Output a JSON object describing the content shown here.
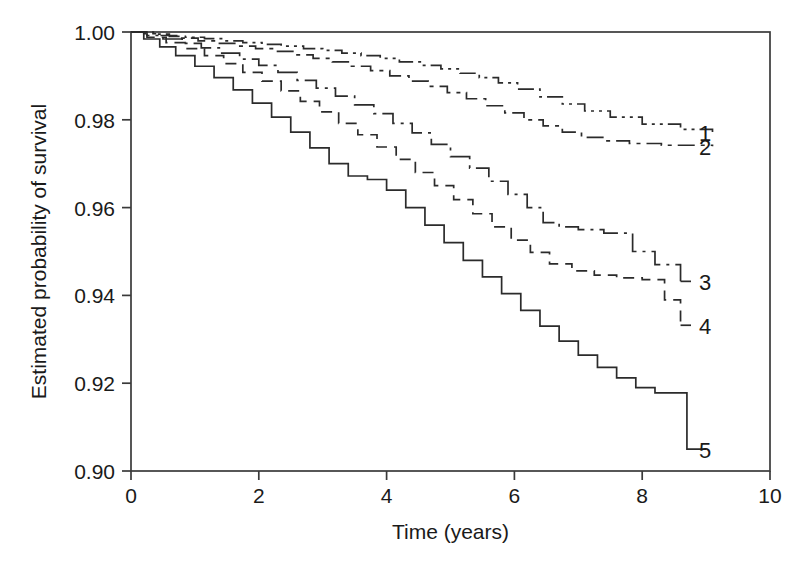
{
  "chart_data": {
    "type": "line",
    "title": "",
    "xlabel": "Time (years)",
    "ylabel": "Estimated probability of survival",
    "xlim": [
      0,
      10
    ],
    "ylim": [
      0.9,
      1.0
    ],
    "xticks": [
      "0",
      "2",
      "4",
      "6",
      "8",
      "10"
    ],
    "xtick_values": [
      0,
      2,
      4,
      6,
      8,
      10
    ],
    "yticks": [
      "1.00",
      "0.98",
      "0.96",
      "0.94",
      "0.92",
      "0.90"
    ],
    "ytick_values": [
      1.0,
      0.98,
      0.96,
      0.94,
      0.92,
      0.9
    ],
    "grid": false,
    "legend_position": "right-of-curve-ends",
    "step_style": "post",
    "series": [
      {
        "name": "1",
        "label": "1",
        "linestyle": "dash-dot-dot",
        "color": "#2b2b2b",
        "final_value": 0.977,
        "x": [
          0.0,
          0.15,
          0.35,
          0.6,
          0.85,
          1.15,
          1.45,
          1.75,
          2.05,
          2.35,
          2.7,
          3.0,
          3.3,
          3.6,
          3.9,
          4.2,
          4.55,
          4.85,
          5.15,
          5.45,
          5.75,
          6.05,
          6.4,
          6.75,
          7.1,
          7.5,
          8.0,
          8.6,
          9.1
        ],
        "y": [
          1.0,
          1.0,
          0.9995,
          0.999,
          0.9988,
          0.9985,
          0.998,
          0.9976,
          0.9972,
          0.9968,
          0.9962,
          0.9958,
          0.9952,
          0.9946,
          0.994,
          0.9932,
          0.9924,
          0.9916,
          0.9906,
          0.9896,
          0.9884,
          0.987,
          0.9852,
          0.9836,
          0.982,
          0.9806,
          0.979,
          0.9778,
          0.9772
        ]
      },
      {
        "name": "2",
        "label": "2",
        "linestyle": "dash-dot",
        "color": "#2b2b2b",
        "final_value": 0.974,
        "x": [
          0.0,
          0.2,
          0.45,
          0.75,
          1.05,
          1.35,
          1.65,
          1.95,
          2.25,
          2.55,
          2.85,
          3.15,
          3.45,
          3.75,
          4.05,
          4.35,
          4.65,
          4.95,
          5.25,
          5.55,
          5.85,
          6.15,
          6.45,
          6.75,
          7.05,
          7.4,
          7.8,
          8.3,
          9.1
        ],
        "y": [
          1.0,
          0.9996,
          0.9992,
          0.9986,
          0.998,
          0.9974,
          0.9968,
          0.9962,
          0.9956,
          0.9948,
          0.994,
          0.9932,
          0.9922,
          0.9912,
          0.99,
          0.9888,
          0.9876,
          0.9862,
          0.9848,
          0.9832,
          0.9816,
          0.98,
          0.9786,
          0.9772,
          0.976,
          0.9752,
          0.9746,
          0.9742,
          0.974
        ]
      },
      {
        "name": "3",
        "label": "3",
        "linestyle": "long-dash-dot",
        "color": "#2b2b2b",
        "final_value": 0.943,
        "x": [
          0.0,
          0.25,
          0.5,
          0.8,
          1.1,
          1.4,
          1.7,
          2.0,
          2.3,
          2.6,
          2.9,
          3.2,
          3.5,
          3.8,
          4.1,
          4.4,
          4.7,
          5.0,
          5.3,
          5.6,
          5.9,
          6.2,
          6.45,
          6.7,
          7.0,
          7.4,
          7.85,
          8.2,
          8.6
        ],
        "y": [
          1.0,
          0.9992,
          0.9984,
          0.9974,
          0.9964,
          0.9952,
          0.9938,
          0.9924,
          0.9908,
          0.989,
          0.9872,
          0.9854,
          0.9834,
          0.9814,
          0.9792,
          0.977,
          0.9744,
          0.9716,
          0.969,
          0.966,
          0.963,
          0.96,
          0.9566,
          0.9556,
          0.955,
          0.9542,
          0.95,
          0.947,
          0.9432
        ]
      },
      {
        "name": "4",
        "label": "4",
        "linestyle": "dashed",
        "color": "#2b2b2b",
        "final_value": 0.933,
        "x": [
          0.0,
          0.25,
          0.55,
          0.85,
          1.15,
          1.45,
          1.75,
          2.05,
          2.35,
          2.65,
          2.95,
          3.25,
          3.55,
          3.85,
          4.15,
          4.45,
          4.75,
          5.05,
          5.35,
          5.65,
          5.95,
          6.25,
          6.55,
          6.9,
          7.25,
          7.6,
          8.0,
          8.35,
          8.6
        ],
        "y": [
          1.0,
          0.9988,
          0.9976,
          0.9962,
          0.9946,
          0.9928,
          0.9908,
          0.9888,
          0.9866,
          0.9842,
          0.9818,
          0.9792,
          0.9766,
          0.9738,
          0.971,
          0.968,
          0.965,
          0.9618,
          0.9586,
          0.9556,
          0.9526,
          0.9498,
          0.9472,
          0.9456,
          0.9446,
          0.944,
          0.9436,
          0.939,
          0.9332
        ]
      },
      {
        "name": "5",
        "label": "5",
        "linestyle": "solid",
        "color": "#2b2b2b",
        "final_value": 0.905,
        "x": [
          0.0,
          0.2,
          0.45,
          0.7,
          1.0,
          1.3,
          1.6,
          1.9,
          2.2,
          2.5,
          2.8,
          3.1,
          3.4,
          3.7,
          4.0,
          4.3,
          4.6,
          4.9,
          5.2,
          5.5,
          5.8,
          6.1,
          6.4,
          6.7,
          7.0,
          7.3,
          7.6,
          7.9,
          8.2,
          8.45,
          8.7,
          9.0
        ],
        "y": [
          1.0,
          0.9984,
          0.9966,
          0.9946,
          0.9922,
          0.9896,
          0.9868,
          0.9838,
          0.9806,
          0.9772,
          0.9736,
          0.97,
          0.9672,
          0.9664,
          0.964,
          0.96,
          0.956,
          0.952,
          0.948,
          0.9442,
          0.9404,
          0.9366,
          0.933,
          0.9296,
          0.9264,
          0.9236,
          0.9212,
          0.919,
          0.9178,
          0.9178,
          0.905,
          0.905
        ]
      }
    ]
  }
}
